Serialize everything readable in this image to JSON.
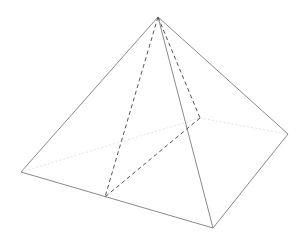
{
  "diagram": {
    "type": "square-pyramid",
    "colors": {
      "visible_edge": "#8a8a8a",
      "dashed_edge": "#555555",
      "hidden_edge": "#e4e4e4",
      "background": "#ffffff"
    },
    "vertices": {
      "apex": [
        158,
        17
      ],
      "left": [
        21,
        172
      ],
      "front": [
        213,
        228
      ],
      "right": [
        288,
        134
      ],
      "back": [
        200,
        118
      ],
      "mid_front_left": [
        105,
        197
      ]
    },
    "edges": {
      "solid": [
        [
          "apex",
          "left"
        ],
        [
          "apex",
          "front"
        ],
        [
          "apex",
          "right"
        ],
        [
          "left",
          "front"
        ],
        [
          "front",
          "right"
        ]
      ],
      "dashed": [
        [
          "apex",
          "mid_front_left"
        ],
        [
          "apex",
          "back"
        ],
        [
          "back",
          "mid_front_left"
        ]
      ],
      "hidden": [
        [
          "left",
          "back"
        ],
        [
          "back",
          "right"
        ]
      ]
    }
  }
}
